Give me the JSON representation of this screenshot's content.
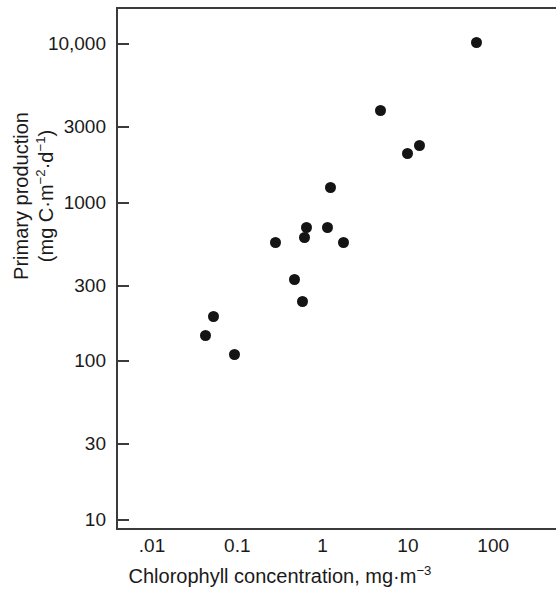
{
  "chart_data": {
    "type": "scatter",
    "title": "",
    "xlabel": "Chlorophyll concentration, mg·m⁻³",
    "ylabel": "Primary production (mg C·m⁻²·d⁻¹)",
    "xscale": "log",
    "yscale": "log",
    "xlim": [
      0.004,
      380
    ],
    "ylim": [
      10,
      17000
    ],
    "grid": false,
    "legend": null,
    "x_tick_labels": [
      ".01",
      "0.1",
      "1",
      "10",
      "100"
    ],
    "x_tick_values": [
      0.01,
      0.1,
      1,
      10,
      100
    ],
    "y_tick_labels": [
      "10,000",
      "3000",
      "1000",
      "300",
      "100",
      "30",
      "10"
    ],
    "y_tick_values": [
      10000,
      3000,
      1000,
      300,
      100,
      30,
      10
    ],
    "marker": {
      "shape": "circle",
      "color": "#141414",
      "size": 11
    },
    "points": [
      {
        "x": 0.042,
        "y": 145
      },
      {
        "x": 0.053,
        "y": 193
      },
      {
        "x": 0.093,
        "y": 110
      },
      {
        "x": 0.28,
        "y": 560
      },
      {
        "x": 0.47,
        "y": 330
      },
      {
        "x": 0.58,
        "y": 240
      },
      {
        "x": 0.62,
        "y": 600
      },
      {
        "x": 0.64,
        "y": 700
      },
      {
        "x": 1.15,
        "y": 700
      },
      {
        "x": 1.25,
        "y": 1250
      },
      {
        "x": 1.75,
        "y": 560
      },
      {
        "x": 4.8,
        "y": 3800
      },
      {
        "x": 9.8,
        "y": 2050
      },
      {
        "x": 13.5,
        "y": 2300
      },
      {
        "x": 64.0,
        "y": 10200
      }
    ],
    "n_points": 15
  },
  "axis": {
    "y_title_line1": "Primary production",
    "y_title_line2_pre": "(mg C·m",
    "y_title_sup1": "−2",
    "y_title_mid": "·d",
    "y_title_sup2": "−1",
    "y_title_close": ")",
    "x_title_pre": "Chlorophyll concentration, mg·m",
    "x_title_sup": "−3"
  }
}
